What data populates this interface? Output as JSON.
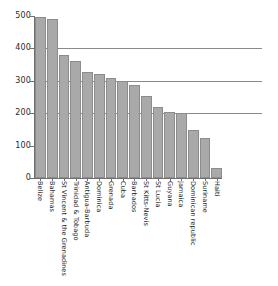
{
  "chart_data": {
    "type": "bar",
    "title": "",
    "subtitle": "",
    "xlabel": "",
    "ylabel": "",
    "ylim": [
      0,
      500
    ],
    "yticks": [
      0,
      100,
      200,
      300,
      400,
      500
    ],
    "ytick_labels": [
      "0",
      "100",
      "200",
      "300",
      "400",
      "500"
    ],
    "grid": "horizontal",
    "gridlines_at": [
      200,
      300,
      400
    ],
    "legend": "none",
    "bar_color": "#a9a9a9",
    "bar_edge_color": "#8c8c8c",
    "axis_color": "#6f6f6f",
    "categories": [
      "Belize",
      "Bahamas",
      "St Vincent & the Grenadines",
      "Trinidad & Tobago",
      "Antigua-Barbuda",
      "Dominica",
      "Grenada",
      "Cuba",
      "Barbados",
      "St Kitts-Nevis",
      "St Lucia",
      "Guyana",
      "Jamaica",
      "Dominican republic",
      "Suriname",
      "Haiti"
    ],
    "values": [
      497,
      492,
      380,
      360,
      327,
      320,
      310,
      300,
      287,
      252,
      219,
      205,
      200,
      147,
      125,
      30
    ]
  }
}
